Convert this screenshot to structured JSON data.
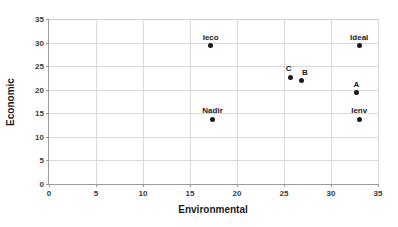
{
  "chart_data": {
    "type": "scatter",
    "title": "",
    "xlabel": "Environmental",
    "ylabel": "Economic",
    "xlim": [
      0,
      35
    ],
    "ylim": [
      0,
      35
    ],
    "xticks": [
      0,
      5,
      10,
      15,
      20,
      25,
      30,
      35
    ],
    "yticks": [
      0,
      5,
      10,
      15,
      20,
      25,
      30,
      35
    ],
    "grid": true,
    "legend": "none",
    "marker_color": "#1a1a1a",
    "points": [
      {
        "label": "Ieco",
        "x": 17.2,
        "y": 29.3,
        "label_dx": 0,
        "label_dy": -13
      },
      {
        "label": "Ideal",
        "x": 33.0,
        "y": 29.3,
        "label_dx": 0,
        "label_dy": -13
      },
      {
        "label": "C",
        "x": 25.7,
        "y": 22.6,
        "label_dx": -2,
        "label_dy": -13
      },
      {
        "label": "B",
        "x": 26.9,
        "y": 22.0,
        "label_dx": 3,
        "label_dy": -12
      },
      {
        "label": "A",
        "x": 32.7,
        "y": 19.4,
        "label_dx": 0,
        "label_dy": -13
      },
      {
        "label": "Ienv",
        "x": 33.0,
        "y": 13.7,
        "label_dx": 0,
        "label_dy": -13
      },
      {
        "label": "Nadir",
        "x": 17.4,
        "y": 13.7,
        "label_dx": 0,
        "label_dy": -13
      }
    ]
  }
}
